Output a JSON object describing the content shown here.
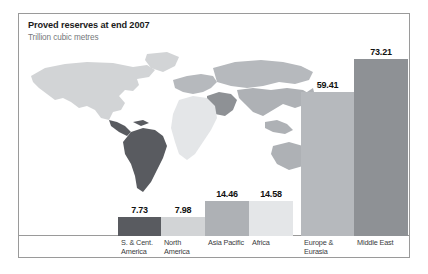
{
  "figure": {
    "title": "Proved reserves at end 2007",
    "subtitle": "Trillion cubic metres"
  },
  "chart_data": {
    "type": "bar",
    "title": "Proved reserves at end 2007",
    "subtitle": "Trillion cubic metres",
    "xlabel": "",
    "ylabel": "Trillion cubic metres",
    "ylim": [
      0,
      73.21
    ],
    "grid": false,
    "legend": "none",
    "categories": [
      "S. & Cent. America",
      "North America",
      "Asia Pacific",
      "Africa",
      "Europe & Eurasia",
      "Middle East"
    ],
    "values": [
      7.73,
      7.98,
      14.46,
      14.58,
      59.41,
      73.21
    ],
    "value_labels": [
      "7.73",
      "7.98",
      "14.46",
      "14.58",
      "59.41",
      "73.21"
    ],
    "bars": [
      {
        "label_lines": [
          "S. & Cent.",
          "America"
        ],
        "value": 7.73,
        "value_label": "7.73",
        "color": "#595b60",
        "x": 99,
        "width": 43
      },
      {
        "label_lines": [
          "North",
          "America"
        ],
        "value": 7.98,
        "value_label": "7.98",
        "color": "#d2d4d6",
        "x": 142,
        "width": 44
      },
      {
        "label_lines": [
          "Asia Pacific"
        ],
        "value": 14.46,
        "value_label": "14.46",
        "color": "#aeb1b5",
        "x": 186,
        "width": 44
      },
      {
        "label_lines": [
          "Africa"
        ],
        "value": 14.58,
        "value_label": "14.58",
        "color": "#e4e6e8",
        "x": 230,
        "width": 44
      },
      {
        "label_lines": [
          "Europe &",
          "Eurasia"
        ],
        "value": 59.41,
        "value_label": "59.41",
        "color": "#b6b9bd",
        "x": 282,
        "width": 53
      },
      {
        "label_lines": [
          "Middle East"
        ],
        "value": 73.21,
        "value_label": "73.21",
        "color": "#8e9195",
        "x": 335,
        "width": 54
      }
    ],
    "map_regions": [
      {
        "name": "south-and-central-america",
        "color": "#595b60"
      },
      {
        "name": "north-america",
        "color": "#d2d4d6"
      },
      {
        "name": "asia-pacific",
        "color": "#aeb1b5"
      },
      {
        "name": "africa",
        "color": "#e4e6e8"
      },
      {
        "name": "europe-and-eurasia",
        "color": "#b6b9bd"
      },
      {
        "name": "middle-east",
        "color": "#8e9195"
      }
    ]
  }
}
